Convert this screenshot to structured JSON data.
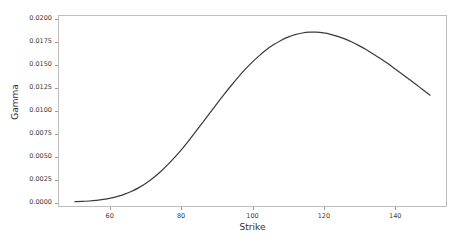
{
  "chart_data": {
    "type": "line",
    "title": "",
    "xlabel": "Strike",
    "ylabel": "Gamma",
    "xlim": [
      45.5,
      154.5
    ],
    "ylim": [
      -0.00042,
      0.02044
    ],
    "grid": false,
    "legend": null,
    "xticks": [
      60,
      80,
      100,
      120,
      140
    ],
    "xtick_labels": [
      "60",
      "80",
      "100",
      "120",
      "140"
    ],
    "yticks": [
      0.0,
      0.0025,
      0.005,
      0.0075,
      0.01,
      0.0125,
      0.015,
      0.0175,
      0.02
    ],
    "ytick_labels": [
      "0.0000",
      "0.0025",
      "0.0050",
      "0.0075",
      "0.0100",
      "0.0125",
      "0.0150",
      "0.0175",
      "0.0200"
    ],
    "line_color": "#3a3a3a",
    "line_width": 1.2,
    "series": [
      {
        "name": "Gamma",
        "x": [
          50,
          52,
          54,
          56,
          58,
          60,
          62,
          64,
          66,
          68,
          70,
          72,
          74,
          76,
          78,
          80,
          82,
          84,
          86,
          88,
          90,
          92,
          94,
          96,
          98,
          100,
          102,
          104,
          106,
          108,
          110,
          112,
          114,
          116,
          118,
          120,
          122,
          124,
          126,
          128,
          130,
          132,
          134,
          136,
          138,
          140,
          142,
          144,
          146,
          148,
          150
        ],
        "values": [
          5e-05,
          8e-05,
          0.00013,
          0.0002,
          0.0003,
          0.00044,
          0.00063,
          0.00088,
          0.0012,
          0.0016,
          0.00208,
          0.00265,
          0.00331,
          0.00406,
          0.00489,
          0.00578,
          0.00674,
          0.00774,
          0.00877,
          0.0098,
          0.01083,
          0.01184,
          0.01281,
          0.01374,
          0.0146,
          0.0154,
          0.01612,
          0.01676,
          0.0173,
          0.01776,
          0.01812,
          0.01839,
          0.01857,
          0.01866,
          0.01866,
          0.01858,
          0.01843,
          0.01821,
          0.01793,
          0.01759,
          0.01719,
          0.01676,
          0.01628,
          0.01577,
          0.01524,
          0.01468,
          0.01411,
          0.01353,
          0.01294,
          0.01234,
          0.01175
        ]
      }
    ],
    "peak": {
      "x": 117,
      "y": 0.01867
    },
    "x_start": 50,
    "x_end": 150,
    "y_start": 5e-05,
    "y_end": 0.0048
  },
  "axes": {
    "frame_color": "#bdbdbd",
    "tick_color": "#9a9a9a",
    "text_color": "#3b3b3b",
    "label_color": "#2e2e2e"
  },
  "figure": {
    "background": "#ffffff",
    "width": 465,
    "height": 243
  }
}
